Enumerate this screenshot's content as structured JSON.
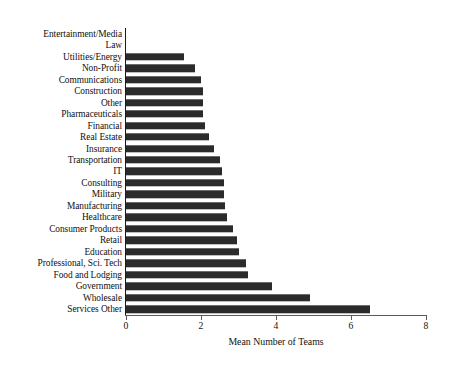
{
  "chart_data": {
    "type": "bar",
    "orientation": "horizontal",
    "title": "",
    "xlabel": "Mean Number of Teams",
    "ylabel": "",
    "xlim": [
      0,
      8
    ],
    "xticks": [
      0,
      2,
      4,
      6,
      8
    ],
    "xtick_labels": [
      "0",
      "2",
      "4",
      "6",
      "8"
    ],
    "grid": false,
    "legend": null,
    "bar_color": "#2b2b2b",
    "axis_color": "#5a5a5a",
    "categories": [
      "Entertainment/Media",
      "Law",
      "Utilities/Energy",
      "Non-Profit",
      "Communications",
      "Construction",
      "Other",
      "Pharmaceuticals",
      "Financial",
      "Real Estate",
      "Insurance",
      "Transportation",
      "IT",
      "Consulting",
      "Military",
      "Manufacturing",
      "Healthcare",
      "Consumer Products",
      "Retail",
      "Education",
      "Professional, Sci. Tech",
      "Food and Lodging",
      "Government",
      "Wholesale",
      "Services Other"
    ],
    "values": [
      0,
      0,
      1.55,
      1.85,
      2.0,
      2.05,
      2.05,
      2.05,
      2.1,
      2.2,
      2.35,
      2.5,
      2.55,
      2.6,
      2.6,
      2.65,
      2.7,
      2.85,
      2.95,
      3.0,
      3.2,
      3.25,
      3.9,
      4.9,
      6.5
    ]
  }
}
